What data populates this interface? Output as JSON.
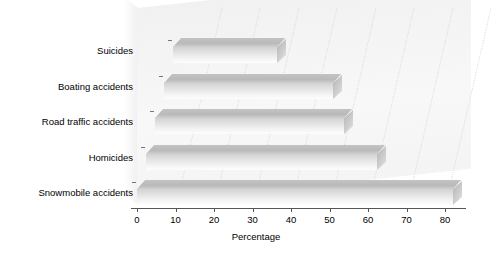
{
  "chart_data": {
    "type": "bar",
    "orientation": "horizontal",
    "style": "3d",
    "title": "",
    "subtitle": "",
    "xlabel": "Percentage",
    "ylabel": "",
    "xlim": [
      0,
      85
    ],
    "xticks": [
      0,
      10,
      20,
      30,
      40,
      50,
      60,
      70,
      80
    ],
    "xtick_labels": [
      "0",
      "10",
      "20",
      "30",
      "40",
      "50",
      "60",
      "70",
      "80"
    ],
    "grid": "vertical-dotted",
    "legend": "none",
    "categories": [
      "Suicides",
      "Boating accidents",
      "Road traffic accidents",
      "Homicides",
      "Snowmobile accidents"
    ],
    "values": [
      27,
      44,
      49,
      60,
      82
    ],
    "bar_color": "#d8d8d8",
    "bar_top_color": "#bfbfbf",
    "plot_background": "#f6f6f6",
    "axis_color": "#555555",
    "gridline_color": "#dcdcdc"
  }
}
